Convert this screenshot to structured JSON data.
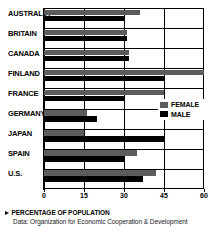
{
  "chart_data": {
    "type": "bar",
    "orientation": "horizontal",
    "title": "",
    "xlabel": "PERCENTAGE OF POPULATION",
    "ylabel": "",
    "xlim": [
      0,
      60
    ],
    "xticks": [
      0,
      15,
      30,
      45,
      60
    ],
    "grid": true,
    "legend_position": "right-middle",
    "categories": [
      "AUSTRALIA",
      "BRITAIN",
      "CANADA",
      "FINLAND",
      "FRANCE",
      "GERMANY",
      "JAPAN",
      "SPAIN",
      "U.S."
    ],
    "series": [
      {
        "name": "FEMALE",
        "color": "#5c5c5c",
        "values": [
          36,
          31,
          32,
          60,
          45,
          16,
          15,
          35,
          42
        ]
      },
      {
        "name": "MALE",
        "color": "#000000",
        "values": [
          30,
          31,
          32,
          45,
          30,
          20,
          45,
          30,
          37
        ]
      }
    ]
  },
  "legend": {
    "items": [
      {
        "label": "FEMALE",
        "swatch": "female-swatch"
      },
      {
        "label": "MALE",
        "swatch": "male-swatch"
      }
    ]
  },
  "footer": {
    "axis_caption": "PERCENTAGE OF POPULATION",
    "source": "Data: Organization for Economic Cooperation & Development"
  }
}
